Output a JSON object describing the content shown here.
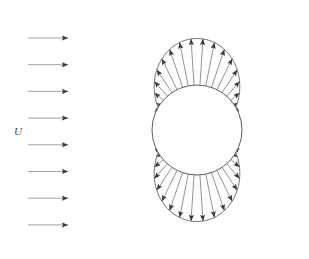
{
  "figure": {
    "title": "",
    "kind": "potential-flow-pressure-distribution-around-circular-cylinder",
    "background_color": "#ffffff",
    "line_color": "#4a4a4a",
    "freestream_line_color": "#8a8a8a",
    "arrow_color": "#3a3a3a"
  },
  "freestream": {
    "label": "U",
    "label_x": 17,
    "label_y": 133,
    "arrow_count": 8,
    "x_start": 28,
    "x_end": 68,
    "y_first": 38,
    "y_spacing": 26.7,
    "direction": "right"
  },
  "cylinder": {
    "center_x": 197,
    "center_y": 130,
    "radius": 45,
    "fill": "#ffffff",
    "stroke": "#4a4a4a"
  },
  "envelope": {
    "visible": true,
    "stroke": "#4a4a4a",
    "description": "curve traced by the tips of the pressure arrows"
  },
  "chart_data": {
    "type": "line",
    "xlabel": "",
    "ylabel": "",
    "series": [
      {
        "name": "pressure-coefficient",
        "formula": "Cp = 1 - 4*sin(theta)^2",
        "theta_deg": [
          0,
          15,
          30,
          45,
          60,
          75,
          90,
          105,
          120,
          135,
          150,
          165,
          180,
          195,
          210,
          225,
          240,
          255,
          270,
          285,
          300,
          315,
          330,
          345
        ],
        "values": [
          1.0,
          0.732,
          0.0,
          -1.0,
          -2.0,
          -2.732,
          -3.0,
          -2.732,
          -2.0,
          -1.0,
          0.0,
          0.732,
          1.0,
          0.732,
          0.0,
          -1.0,
          -2.0,
          -2.732,
          -3.0,
          -2.732,
          -2.0,
          -1.0,
          0.0,
          0.732
        ]
      }
    ],
    "annotations": [
      "U"
    ],
    "legend": "none",
    "grid": false,
    "arrow_convention": "arrows point outward where Cp is negative (suction) and inward toward the surface where Cp is positive (compression near the stagnation points)",
    "arrow_count_around_cylinder": 48,
    "stagnation_points_deg": [
      0,
      180
    ],
    "zero_pressure_points_deg": [
      30,
      150,
      210,
      330
    ]
  }
}
